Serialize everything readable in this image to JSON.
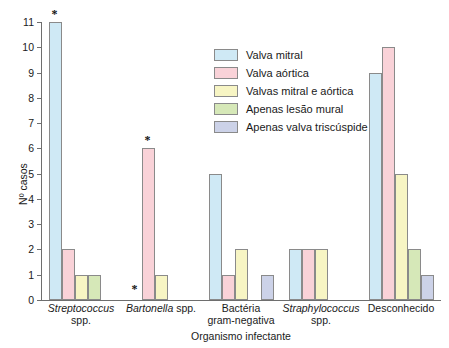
{
  "chart_data": {
    "type": "bar",
    "title": "",
    "xlabel": "Organismo infectante",
    "ylabel": "Nº casos",
    "ylim": [
      0,
      11
    ],
    "yticks": [
      0,
      1,
      2,
      3,
      4,
      5,
      6,
      7,
      8,
      9,
      10,
      11
    ],
    "grid": false,
    "legend_position": "upper-center-right",
    "categories": [
      "Streptococcus spp.",
      "Bartonella spp.",
      "Bactéria gram-negativa",
      "Straphylococcus spp.",
      "Desconhecido"
    ],
    "category_lines": [
      [
        "Streptococcus",
        "spp."
      ],
      [
        "Bartonella spp."
      ],
      [
        "Bactéria",
        "gram-negativa"
      ],
      [
        "Straphylococcus",
        "spp."
      ],
      [
        "Desconhecido"
      ]
    ],
    "category_italic_first_word": [
      true,
      true,
      false,
      true,
      false
    ],
    "series": [
      {
        "name": "Valva mitral",
        "color": "#cfe9f5",
        "values": [
          11,
          0,
          5,
          2,
          9
        ]
      },
      {
        "name": "Valva aórtica",
        "color": "#f9d2d8",
        "values": [
          2,
          6,
          1,
          2,
          10
        ]
      },
      {
        "name": "Valvas mitral e aórtica",
        "color": "#f7f5c4",
        "values": [
          1,
          1,
          2,
          2,
          5
        ]
      },
      {
        "name": "Apenas lesão mural",
        "color": "#d6e8b8",
        "values": [
          1,
          0,
          0,
          0,
          2
        ]
      },
      {
        "name": "Apenas valva triscúspide",
        "color": "#ccd2e8",
        "values": [
          0,
          0,
          1,
          0,
          1
        ]
      }
    ],
    "annotations": [
      {
        "symbol": "*",
        "group": 0,
        "series": 0,
        "note": "above bar of value 11"
      },
      {
        "symbol": "*",
        "group": 1,
        "series": 0,
        "note": "at baseline, zero value"
      },
      {
        "symbol": "*",
        "group": 1,
        "series": 1,
        "note": "above bar of value 6"
      }
    ]
  }
}
